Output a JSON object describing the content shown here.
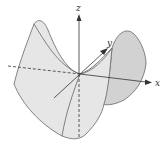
{
  "diagram": {
    "axes": {
      "z_label": "z",
      "y_label": "y",
      "x_label": "x"
    },
    "colors": {
      "surface_fill": "#e6e6e6",
      "surface_fill_dark": "#d2d2d2",
      "edge": "#666666",
      "axis": "#333333"
    }
  }
}
